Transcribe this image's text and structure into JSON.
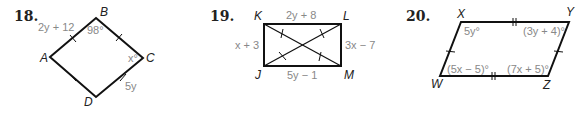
{
  "problems": [
    {
      "number": "18.",
      "shape": "rhombus",
      "vertices": {
        "A": "A",
        "B": "B",
        "C": "C",
        "D": "D"
      },
      "labels": {
        "side_AB": "2y + 12",
        "angle_B": "98°",
        "angle_C": "x°",
        "side_CD": "5y"
      }
    },
    {
      "number": "19.",
      "shape": "rectangle",
      "vertices": {
        "K": "K",
        "L": "L",
        "J": "J",
        "M": "M"
      },
      "labels": {
        "side_KL": "2y + 8",
        "side_KJ": "x + 3",
        "side_LM": "3x − 7",
        "side_JM": "5y − 1"
      }
    },
    {
      "number": "20.",
      "shape": "parallelogram",
      "vertices": {
        "X": "X",
        "Y": "Y",
        "W": "W",
        "Z": "Z"
      },
      "labels": {
        "angle_X": "5y°",
        "angle_Y": "(3y + 4)°",
        "angle_W": "(5x − 5)°",
        "angle_Z": "(7x + 5)°"
      }
    }
  ]
}
